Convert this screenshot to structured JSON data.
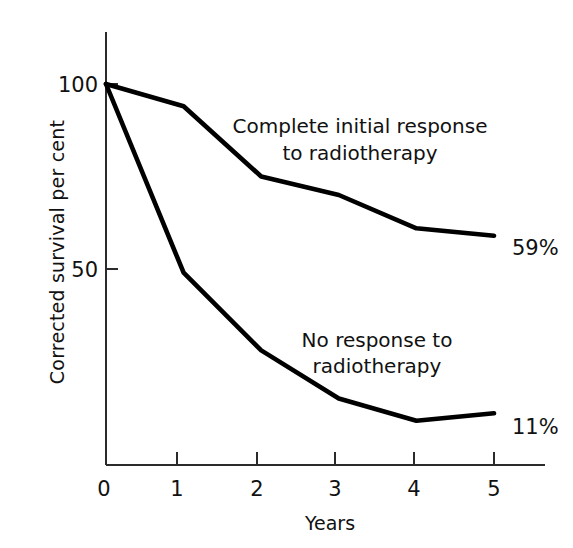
{
  "chart_data": {
    "type": "line",
    "title": "",
    "xlabel": "Years",
    "ylabel": "Corrected survival per cent",
    "x": [
      0,
      1,
      2,
      3,
      4,
      5
    ],
    "xlim": [
      0,
      5.35
    ],
    "ylim": [
      0,
      105
    ],
    "xticks": [
      "0",
      "1",
      "2",
      "3",
      "4",
      "5"
    ],
    "yticks": [
      "100",
      "50"
    ],
    "grid": false,
    "legend_position": "inline-annotations",
    "series": [
      {
        "name": "Complete initial response to radiotherapy",
        "values": [
          100,
          94,
          75,
          70,
          61,
          59
        ],
        "end_label": "59%",
        "annotation": "Complete initial response\nto radiotherapy",
        "annotation_line1": "Complete initial response",
        "annotation_line2": "to radiotherapy"
      },
      {
        "name": "No response to radiotherapy",
        "values": [
          100,
          49,
          28,
          15,
          9,
          11
        ],
        "end_label": "11%",
        "annotation": "No response to\nradiotherapy",
        "annotation_line1": "No response to",
        "annotation_line2": "radiotherapy"
      }
    ],
    "colors": {
      "line": "#000000",
      "axis": "#2b2b2b",
      "background": "#ffffff",
      "text": "#111111"
    }
  },
  "axes": {
    "y_tick_100": "100",
    "y_tick_50": "50",
    "x_tick_0": "0",
    "x_tick_1": "1",
    "x_tick_2": "2",
    "x_tick_3": "3",
    "x_tick_4": "4",
    "x_tick_5": "5",
    "x_axis_title": "Years",
    "y_axis_title": "Corrected survival per cent"
  },
  "annotations": {
    "upper_line1": "Complete initial response",
    "upper_line2": "to radiotherapy",
    "lower_line1": "No response to",
    "lower_line2": "radiotherapy",
    "upper_endpoint": "59%",
    "lower_endpoint": "11%"
  }
}
